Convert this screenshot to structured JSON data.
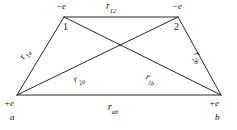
{
  "figure": {
    "background_color": "#ffffff",
    "line_color": "#2b2b2b",
    "text_color": "#111111",
    "line_width": 1
  },
  "charges": {
    "top_left": "−e",
    "top_right": "−e",
    "bottom_left": "+e",
    "bottom_right": "+e"
  },
  "vertices": {
    "one": "1",
    "two": "2",
    "a": "a",
    "b": "b"
  },
  "distances": {
    "top": {
      "base": "r",
      "sub": "12"
    },
    "left": {
      "base": "r",
      "sub": "1a"
    },
    "right": {
      "base": "r",
      "sub": "2b"
    },
    "diagonal_left": {
      "base": "r",
      "sub": "2a"
    },
    "diagonal_right": {
      "base": "r",
      "sub": "1b"
    },
    "bottom": {
      "base": "r",
      "sub": "ab"
    }
  },
  "geometry": {
    "points": {
      "one": {
        "x": 64,
        "y": 17
      },
      "two": {
        "x": 178,
        "y": 17
      },
      "a": {
        "x": 17,
        "y": 95
      },
      "b": {
        "x": 221,
        "y": 95
      }
    },
    "edges": [
      {
        "name": "top",
        "from": "one",
        "to": "two"
      },
      {
        "name": "left",
        "from": "a",
        "to": "one"
      },
      {
        "name": "right",
        "from": "two",
        "to": "b"
      },
      {
        "name": "bottom",
        "from": "a",
        "to": "b"
      },
      {
        "name": "diagonal-a-two",
        "from": "a",
        "to": "two"
      },
      {
        "name": "diagonal-one-b",
        "from": "one",
        "to": "b"
      }
    ],
    "crossing_point": {
      "x": 119,
      "y": 50
    }
  }
}
